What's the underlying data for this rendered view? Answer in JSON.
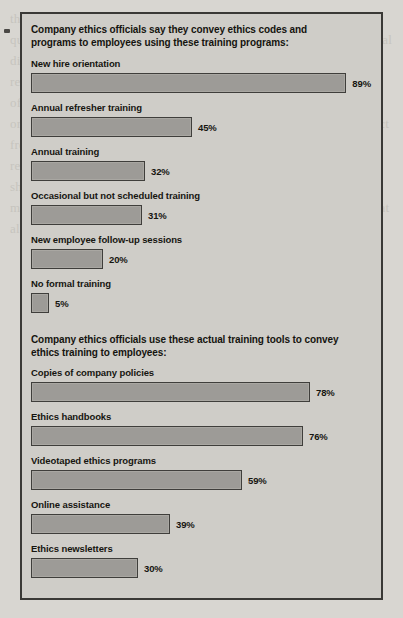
{
  "chart_data": {
    "type": "bar",
    "orientation": "horizontal",
    "title": "",
    "xlabel": "",
    "ylabel": "",
    "xlim": [
      0,
      100
    ],
    "grid": false,
    "legend": null,
    "value_suffix": "%",
    "sections": [
      {
        "heading": "Company ethics officials say they convey ethics codes and programs to employees using these training programs:",
        "categories": [
          "New hire orientation",
          "Annual refresher training",
          "Annual training",
          "Occasional but not scheduled training",
          "New employee follow-up sessions",
          "No formal training"
        ],
        "values": [
          89,
          45,
          32,
          31,
          20,
          5
        ],
        "labels": [
          "89%",
          "45%",
          "32%",
          "31%",
          "20%",
          "5%"
        ]
      },
      {
        "heading": "Company ethics officials use these actual training tools to convey ethics training to employees:",
        "categories": [
          "Copies of company policies",
          "Ethics handbooks",
          "Videotaped ethics programs",
          "Online assistance",
          "Ethics newsletters"
        ],
        "values": [
          78,
          76,
          59,
          39,
          30
        ],
        "labels": [
          "78%",
          "76%",
          "59%",
          "39%",
          "30%"
        ]
      }
    ],
    "colors": {
      "bar_fill": "#9d9b97",
      "bar_border": "#3f3e3b",
      "panel_background": "#cfcdc8",
      "panel_border": "#3a3936",
      "page_background": "#d8d6d1",
      "text": "#161510"
    }
  },
  "page": {
    "ghost_text": "the decisions in their own work. The company also has a list of questions employees can ask themselves whenever they face an ethical dilemma. Many firms now provide an ethics hotline so workers may report misconduct anonymously and get guidance on the right course of action. A strong ethics program needs support from the top of the organization, with senior managers modeling the behavior they expect from everyone else. Training sessions, printed codes, and regular reminders all keep the standards visible. Surveys of ethics officers show that new hire orientation remains the most common delivery method, while very few companies report having no formal training at all."
  }
}
